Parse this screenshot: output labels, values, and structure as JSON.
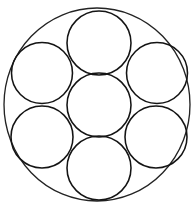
{
  "figure": {
    "background_color": "#ffffff",
    "stroke_color": "#1a1a1a",
    "outer_stroke_color": "#232323",
    "inner_stroke_color": "#141414",
    "width": 196,
    "height": 207
  },
  "chart_data": {
    "type": "diagram",
    "subtitle": "",
    "xlabel": "",
    "ylabel": "",
    "grid": false,
    "legend": "none",
    "xlim": [
      0,
      196
    ],
    "ylim": [
      0,
      207
    ],
    "outer_circle": {
      "name": "outer-boundary-circle",
      "cx": 97,
      "cy": 104.5,
      "rx": 93,
      "ry": 96.5
    },
    "circles": [
      {
        "name": "center-circle",
        "position": "center",
        "cx": 99,
        "cy": 105,
        "r": 32
      },
      {
        "name": "top-circle",
        "position": "top",
        "cx": 99,
        "cy": 43,
        "r": 32
      },
      {
        "name": "upper-left-circle",
        "position": "upper-left",
        "cx": 42,
        "cy": 73,
        "r": 30.5
      },
      {
        "name": "upper-right-circle",
        "position": "upper-right",
        "cx": 157,
        "cy": 73,
        "r": 30.5
      },
      {
        "name": "lower-left-circle",
        "position": "lower-left",
        "cx": 42,
        "cy": 137,
        "r": 31
      },
      {
        "name": "lower-right-circle",
        "position": "lower-right",
        "cx": 156,
        "cy": 137,
        "r": 31
      },
      {
        "name": "bottom-circle",
        "position": "bottom",
        "cx": 99,
        "cy": 168,
        "r": 32
      }
    ],
    "circle_count": 7,
    "annotations": []
  }
}
